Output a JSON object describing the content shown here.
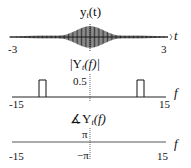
{
  "panels": {
    "time": {
      "title_main": "y",
      "title_sub": "t",
      "title_arg": "(t)",
      "axis_var": "t",
      "tick_left": "-3",
      "tick_right": "3"
    },
    "magnitude": {
      "title_pre": "|Y",
      "title_sub": "t",
      "title_arg": "(f)|",
      "ytick": "0.5",
      "axis_var": "f",
      "tick_left": "-15",
      "tick_right": "15"
    },
    "phase": {
      "title_pre": "∡Y",
      "title_sub": "t",
      "title_arg": "(f)",
      "ytick_top": "π",
      "ytick_bottom": "−π",
      "axis_var": "f",
      "tick_left": "-15",
      "tick_right": "15"
    }
  },
  "chart_data": [
    {
      "type": "line",
      "title": "y_t(t)",
      "xlabel": "t",
      "xlim": [
        -3,
        3
      ],
      "description": "Amplitude-modulated oscillation (high-frequency carrier ~10 Hz) with envelope peaking at t=0 and decaying toward ±3",
      "x_ticks": [
        "-3",
        "3"
      ]
    },
    {
      "type": "line",
      "title": "|Y_t(f)|",
      "xlabel": "f",
      "xlim": [
        -15,
        15
      ],
      "y_ticks": [
        "0.5"
      ],
      "series": [
        {
          "name": "magnitude",
          "points": [
            [
              -15,
              0
            ],
            [
              -10.5,
              0
            ],
            [
              -10.5,
              0.5
            ],
            [
              -9.5,
              0.5
            ],
            [
              -9.5,
              0
            ],
            [
              9.5,
              0
            ],
            [
              9.5,
              0.5
            ],
            [
              10.5,
              0.5
            ],
            [
              10.5,
              0
            ],
            [
              15,
              0
            ]
          ]
        }
      ],
      "x_ticks": [
        "-15",
        "15"
      ]
    },
    {
      "type": "line",
      "title": "∡Y_t(f)",
      "xlabel": "f",
      "xlim": [
        -15,
        15
      ],
      "y_ticks": [
        "π",
        "−π"
      ],
      "series": [
        {
          "name": "phase",
          "points": [
            [
              -15,
              0
            ],
            [
              15,
              0
            ]
          ]
        }
      ],
      "x_ticks": [
        "-15",
        "15"
      ]
    }
  ]
}
